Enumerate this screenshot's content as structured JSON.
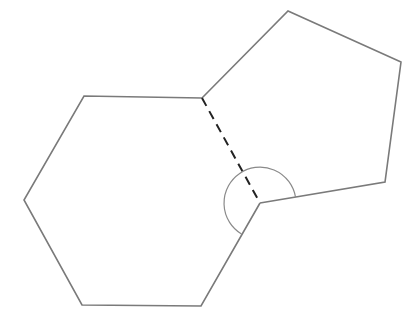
{
  "diagram": {
    "colors": {
      "background": "#ffffff",
      "outline": "#7a7a7a",
      "shared_edge": "#222222",
      "angle_arc": "#8a8a8a"
    },
    "hexagon": {
      "label": "hexagon",
      "points": "202,98 84,96 24,200 82,305 201,306 260,203"
    },
    "pentagon": {
      "label": "pentagon",
      "points": "202,98 288,11 401,62 385,182 260,203"
    },
    "shared_edge": {
      "x1": 202,
      "y1": 98,
      "x2": 260,
      "y2": 203
    },
    "angle_arc": {
      "center": [
        260,
        203
      ],
      "radius": 36,
      "path": "M 295.5,197 A 36 36 0 1 0 241.5,234"
    }
  }
}
